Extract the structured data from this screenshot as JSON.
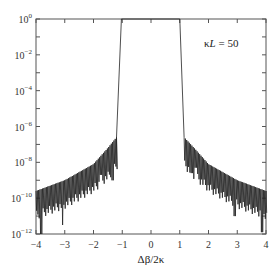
{
  "chart_data": {
    "type": "line",
    "title": "",
    "xlabel": "Δβ/2κ",
    "ylabel": "",
    "xlim": [
      -4,
      4
    ],
    "ylim_log10": [
      -12,
      0
    ],
    "yscale": "log",
    "grid": false,
    "legend": null,
    "annotation": "κL = 50",
    "x_ticks": [
      -4,
      -3,
      -2,
      -1,
      0,
      1,
      2,
      3,
      4
    ],
    "x_tick_labels": [
      "−4",
      "−3",
      "−2",
      "−1",
      "0",
      "1",
      "2",
      "3",
      "4"
    ],
    "y_ticks_log10": [
      0,
      -2,
      -4,
      -6,
      -8,
      -10,
      -12
    ],
    "y_tick_labels": [
      {
        "base": "10",
        "exp": "0"
      },
      {
        "base": "10",
        "exp": "−2"
      },
      {
        "base": "10",
        "exp": "−4"
      },
      {
        "base": "10",
        "exp": "−6"
      },
      {
        "base": "10",
        "exp": "−8"
      },
      {
        "base": "10",
        "exp": "−10"
      },
      {
        "base": "10",
        "exp": "−12"
      }
    ],
    "series": [
      {
        "name": "reflectivity",
        "description": "Flat-top stopband at ~1 for |Δβ/2κ| ≲ 1, steep edges, then rapidly oscillating sidelobes whose envelope falls from ~1e-6.5 near |x|≈1.2 to ~1e-10 at |x|=4, with deep nulls reaching ~1e-11 to 1e-12.",
        "stopband": {
          "x_top": [
            -1.03,
            1.0
          ],
          "x_bottom": [
            -1.2,
            1.15
          ],
          "value": 1.0
        },
        "envelope_points": [
          {
            "x": -4.0,
            "log10_upper": -9.6,
            "log10_lower": -10.4
          },
          {
            "x": -3.0,
            "log10_upper": -9.0,
            "log10_lower": -9.8
          },
          {
            "x": -2.0,
            "log10_upper": -8.1,
            "log10_lower": -8.9
          },
          {
            "x": -1.5,
            "log10_upper": -7.2,
            "log10_lower": -8.2
          },
          {
            "x": -1.2,
            "log10_upper": -6.6,
            "log10_lower": -7.6
          },
          {
            "x": 1.15,
            "log10_upper": -6.6,
            "log10_lower": -7.6
          },
          {
            "x": 1.5,
            "log10_upper": -7.2,
            "log10_lower": -8.2
          },
          {
            "x": 2.0,
            "log10_upper": -8.1,
            "log10_lower": -8.9
          },
          {
            "x": 3.0,
            "log10_upper": -9.0,
            "log10_lower": -9.8
          },
          {
            "x": 4.0,
            "log10_upper": -9.6,
            "log10_lower": -10.4
          }
        ],
        "deep_nulls": [
          {
            "x": -3.85,
            "log10": -12
          },
          {
            "x": -3.1,
            "log10": -11.5
          },
          {
            "x": -1.75,
            "log10": -8.7
          },
          {
            "x": -1.35,
            "log10": -9.0
          },
          {
            "x": 1.4,
            "log10": -8.6
          },
          {
            "x": 1.55,
            "log10": -8.3
          },
          {
            "x": 2.9,
            "log10": -11.0
          },
          {
            "x": 3.85,
            "log10": -11.9
          }
        ]
      }
    ]
  }
}
